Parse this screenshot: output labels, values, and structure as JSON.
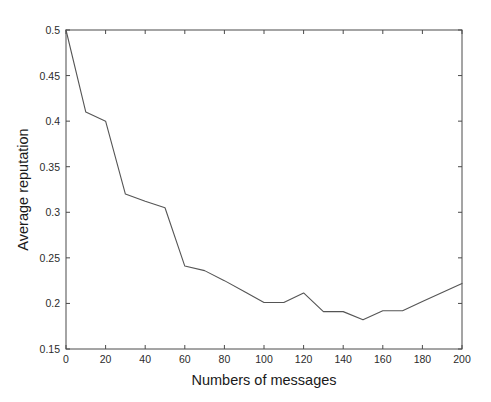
{
  "chart_data": {
    "type": "line",
    "title": "",
    "xlabel": "Numbers of messages",
    "ylabel": "Average reputation",
    "xlim": [
      0,
      200
    ],
    "ylim": [
      0.15,
      0.5
    ],
    "xticks": [
      0,
      20,
      40,
      60,
      80,
      100,
      120,
      140,
      160,
      180,
      200
    ],
    "xtick_labels": [
      "0",
      "20",
      "40",
      "60",
      "80",
      "100",
      "120",
      "140",
      "160",
      "180",
      "200"
    ],
    "yticks": [
      0.15,
      0.2,
      0.25,
      0.3,
      0.35,
      0.4,
      0.45,
      0.5
    ],
    "ytick_labels": [
      "0.15",
      "0.2",
      "0.25",
      "0.3",
      "0.35",
      "0.4",
      "0.45",
      "0.5"
    ],
    "grid": false,
    "legend": null,
    "line_color": "#555555",
    "box": true,
    "x": [
      0,
      10,
      20,
      30,
      40,
      50,
      60,
      70,
      80,
      90,
      100,
      110,
      120,
      130,
      140,
      150,
      160,
      170,
      180,
      190,
      200
    ],
    "values": [
      0.5,
      0.41,
      0.4,
      0.32,
      0.312,
      0.305,
      0.241,
      0.236,
      0.225,
      0.213,
      0.201,
      0.201,
      0.2115,
      0.191,
      0.191,
      0.182,
      0.192,
      0.192,
      0.202,
      0.212,
      0.222
    ],
    "series": [
      {
        "name": "Average reputation",
        "values": [
          0.5,
          0.41,
          0.4,
          0.32,
          0.312,
          0.305,
          0.241,
          0.236,
          0.225,
          0.213,
          0.201,
          0.201,
          0.2115,
          0.191,
          0.191,
          0.182,
          0.192,
          0.192,
          0.202,
          0.212,
          0.222
        ]
      }
    ]
  }
}
